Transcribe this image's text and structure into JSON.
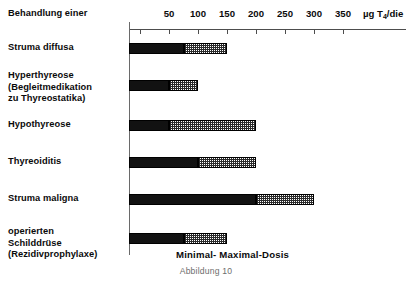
{
  "caption": "Abbildung 10",
  "legend": "Minimal- Maximal-Dosis",
  "axis_unit": "µg T",
  "axis_unit_sub": "4",
  "axis_unit_tail": "/die",
  "row_header": "Behandlung einer",
  "chart_data": {
    "type": "bar",
    "orientation": "horizontal",
    "title": "Behandlung einer",
    "xlabel": "µg T4/die",
    "ylabel": "",
    "xlim": [
      0,
      380
    ],
    "xticks": [
      50,
      100,
      150,
      200,
      250,
      300,
      350
    ],
    "xtick_labels": [
      "50",
      "100",
      "150",
      "200",
      "250",
      "300",
      "350"
    ],
    "grid": false,
    "legend_position": "bottom-inside",
    "series": [
      {
        "name": "Minimal-Dosis",
        "style": "solid-black"
      },
      {
        "name": "Maximal-Dosis",
        "style": "hatched"
      }
    ],
    "categories": [
      "Struma diffusa",
      "Hyperthyreose (Begleitmedikation zu Thyreostatika)",
      "Hypothyreose",
      "Thyreoiditis",
      "Struma maligna",
      "operierten Schilddrüse (Rezidivprophylaxe)"
    ],
    "minimal_values": [
      75,
      50,
      50,
      100,
      200,
      75
    ],
    "maximal_values": [
      150,
      100,
      200,
      200,
      300,
      150
    ]
  },
  "rows": [
    {
      "label_lines": [
        "Struma diffusa"
      ],
      "min": 75,
      "max": 150
    },
    {
      "label_lines": [
        "Hyperthyreose",
        "(Begleitmedikation",
        "zu Thyreostatika)"
      ],
      "min": 50,
      "max": 100
    },
    {
      "label_lines": [
        "Hypothyreose"
      ],
      "min": 50,
      "max": 200
    },
    {
      "label_lines": [
        "Thyreoiditis"
      ],
      "min": 100,
      "max": 200
    },
    {
      "label_lines": [
        "Struma maligna"
      ],
      "min": 200,
      "max": 300
    },
    {
      "label_lines": [
        "operierten",
        "Schilddrüse",
        "(Rezidivprophylaxe)"
      ],
      "min": 75,
      "max": 150
    }
  ],
  "labels": {
    "row0": "Struma diffusa",
    "row1_l0": "Hyperthyreose",
    "row1_l1": "(Begleitmedikation",
    "row1_l2": "zu Thyreostatika)",
    "row2": "Hypothyreose",
    "row3": "Thyreoiditis",
    "row4": "Struma maligna",
    "row5_l0": "operierten",
    "row5_l1": "Schilddrüse",
    "row5_l2": "(Rezidivprophylaxe)"
  },
  "ticks": {
    "t0": "50",
    "t1": "100",
    "t2": "150",
    "t3": "200",
    "t4": "250",
    "t5": "300",
    "t6": "350"
  }
}
